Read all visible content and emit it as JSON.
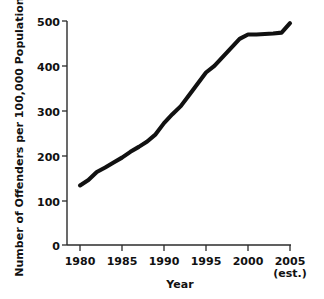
{
  "chart_data": {
    "type": "line",
    "title": "",
    "xlabel": "Year",
    "ylabel": "Number of Offenders per 100,000 Population",
    "xlim": [
      1980,
      2005
    ],
    "ylim": [
      0,
      500
    ],
    "grid": false,
    "legend": false,
    "xticks": [
      {
        "value": 1980,
        "label": "1980",
        "sublabel": ""
      },
      {
        "value": 1985,
        "label": "1985",
        "sublabel": ""
      },
      {
        "value": 1990,
        "label": "1990",
        "sublabel": ""
      },
      {
        "value": 1995,
        "label": "1995",
        "sublabel": ""
      },
      {
        "value": 2000,
        "label": "2000",
        "sublabel": ""
      },
      {
        "value": 2005,
        "label": "2005",
        "sublabel": "(est.)"
      }
    ],
    "yticks": [
      {
        "value": 0,
        "label": "0"
      },
      {
        "value": 100,
        "label": "100"
      },
      {
        "value": 200,
        "label": "200"
      },
      {
        "value": 300,
        "label": "300"
      },
      {
        "value": 400,
        "label": "400"
      },
      {
        "value": 500,
        "label": "500"
      }
    ],
    "series": [
      {
        "name": "Offenders per 100,000 Population",
        "color": "#111111",
        "x": [
          1980,
          1981,
          1982,
          1983,
          1984,
          1985,
          1986,
          1987,
          1988,
          1989,
          1990,
          1991,
          1992,
          1993,
          1994,
          1995,
          1996,
          1997,
          1998,
          1999,
          2000,
          2001,
          2002,
          2003,
          2004,
          2005
        ],
        "values": [
          133,
          145,
          163,
          173,
          184,
          195,
          208,
          219,
          231,
          247,
          272,
          292,
          310,
          335,
          360,
          385,
          400,
          420,
          440,
          460,
          470,
          470,
          471,
          472,
          474,
          495
        ]
      }
    ],
    "annotations": []
  },
  "layout": {
    "axis_color": "#2b2b2b",
    "line_color": "#111111",
    "background": "#ffffff"
  }
}
